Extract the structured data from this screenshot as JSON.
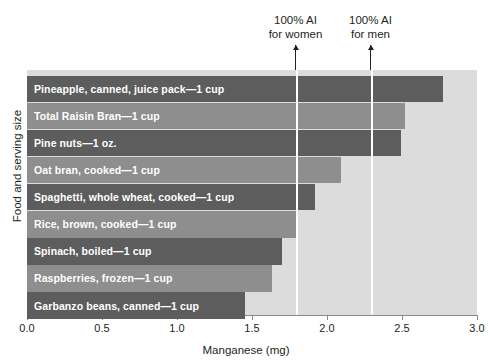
{
  "chart_data": {
    "type": "bar",
    "orientation": "horizontal",
    "title": "",
    "xlabel": "Manganese (mg)",
    "ylabel": "Food and serving size",
    "xlim": [
      0.0,
      3.0
    ],
    "xticks": [
      "0.0",
      "0.5",
      "1.0",
      "1.5",
      "2.0",
      "2.5",
      "3.0"
    ],
    "xtick_values": [
      0.0,
      0.5,
      1.0,
      1.5,
      2.0,
      2.5,
      3.0
    ],
    "grid": false,
    "legend": "none",
    "categories": [
      "Pineapple, canned, juice pack—1 cup",
      "Total Raisin Bran—1 cup",
      "Pine nuts—1 oz.",
      "Oat bran, cooked—1 cup",
      "Spaghetti, whole wheat, cooked—1 cup",
      "Rice, brown, cooked—1 cup",
      "Spinach, boiled—1 cup",
      "Raspberries, frozen—1 cup",
      "Garbanzo beans, canned—1 cup"
    ],
    "values": [
      2.77,
      2.52,
      2.49,
      2.09,
      1.92,
      1.79,
      1.7,
      1.63,
      1.45
    ],
    "bar_colors": [
      "#5d5d5d",
      "#8e8e8e",
      "#5d5d5d",
      "#8e8e8e",
      "#5d5d5d",
      "#8e8e8e",
      "#5d5d5d",
      "#8e8e8e",
      "#5d5d5d"
    ],
    "plot_background": "#dcdcdc",
    "reference_lines": [
      {
        "label_line1": "100% AI",
        "label_line2": "for women",
        "value": 1.79,
        "color": "#ffffff"
      },
      {
        "label_line1": "100% AI",
        "label_line2": "for men",
        "value": 2.29,
        "color": "#ffffff"
      }
    ]
  }
}
